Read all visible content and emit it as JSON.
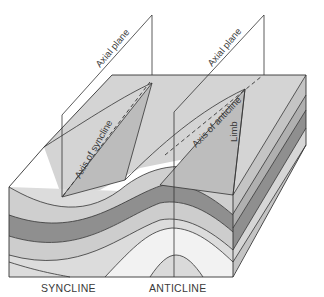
{
  "diagram": {
    "labels": {
      "axial_plane_left": "Axial plane",
      "axial_plane_right": "Axial plane",
      "axis_of_syncline": "Axis of syncline",
      "axis_of_anticline": "Axis of anticline",
      "limb": "Limb"
    },
    "captions": {
      "syncline": "SYNCLINE",
      "anticline": "ANTICLINE"
    },
    "colors": {
      "top_surface": "#d4d4d4",
      "limb_plane": "#b9b9b9",
      "light_layer": "#dcdcdc",
      "mid_layer": "#c2c2c2",
      "dark_layer": "#8f8f8f",
      "core_light": "#f2f2f2",
      "outline": "#333333"
    }
  }
}
